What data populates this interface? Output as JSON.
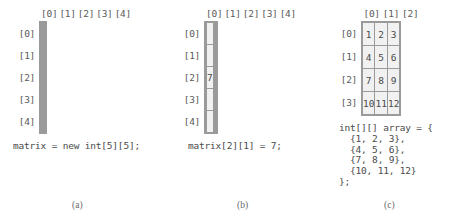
{
  "figure": {
    "panels": [
      {
        "id": "a",
        "caption": "(a)",
        "column_headers": [
          "[0]",
          "[1]",
          "[2]",
          "[3]",
          "[4]"
        ],
        "row_labels": [
          "[0]",
          "[1]",
          "[2]",
          "[3]",
          "[4]"
        ],
        "cells": [
          [
            "",
            "",
            "",
            "",
            ""
          ],
          [
            "",
            "",
            "",
            "",
            ""
          ],
          [
            "",
            "",
            "",
            "",
            ""
          ],
          [
            "",
            "",
            "",
            "",
            ""
          ],
          [
            "",
            "",
            "",
            "",
            ""
          ]
        ],
        "code": "matrix = new int[5][5];"
      },
      {
        "id": "b",
        "caption": "(b)",
        "column_headers": [
          "[0]",
          "[1]",
          "[2]",
          "[3]",
          "[4]"
        ],
        "row_labels": [
          "[0]",
          "[1]",
          "[2]",
          "[3]",
          "[4]"
        ],
        "cells": [
          [
            "",
            "",
            "",
            "",
            ""
          ],
          [
            "",
            "",
            "",
            "",
            ""
          ],
          [
            "",
            "7",
            "",
            "",
            ""
          ],
          [
            "",
            "",
            "",
            "",
            ""
          ],
          [
            "",
            "",
            "",
            "",
            ""
          ]
        ],
        "code": "matrix[2][1] = 7;"
      },
      {
        "id": "c",
        "caption": "(c)",
        "column_headers": [
          "[0]",
          "[1]",
          "[2]"
        ],
        "row_labels": [
          "[0]",
          "[1]",
          "[2]",
          "[3]"
        ],
        "cells": [
          [
            "1",
            "2",
            "3"
          ],
          [
            "4",
            "5",
            "6"
          ],
          [
            "7",
            "8",
            "9"
          ],
          [
            "10",
            "11",
            "12"
          ]
        ],
        "code": "int[][] array = {\n  {1, 2, 3},\n  {4, 5, 6},\n  {7, 8, 9},\n  {10, 11, 12}\n};"
      }
    ]
  },
  "colors": {
    "cell_fill": "#f1f1f1",
    "cell_border": "#9a9a9a",
    "text": "#4a4a4a",
    "caption": "#6a6a6a",
    "background": "#ffffff"
  }
}
